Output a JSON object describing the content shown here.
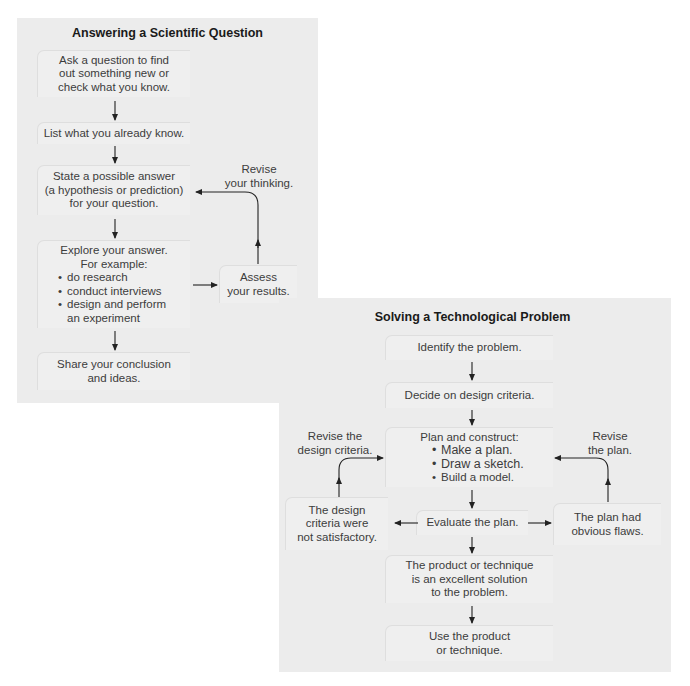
{
  "scientific": {
    "title": "Answering a Scientific Question",
    "boxes": {
      "ask": [
        "Ask a question to find",
        "out something new or",
        "check what you know."
      ],
      "list": [
        "List what you already know."
      ],
      "state": [
        "State a possible answer",
        "(a hypothesis or prediction)",
        "for your question."
      ],
      "explore": {
        "heading": [
          "Explore your answer.",
          "For example:"
        ],
        "bullets": [
          "do research",
          "conduct interviews",
          "design and perform"
        ],
        "continuation": "an experiment"
      },
      "share": [
        "Share your conclusion",
        "and ideas."
      ],
      "assess": [
        "Assess",
        "your results."
      ]
    },
    "labels": {
      "revise_thinking": [
        "Revise",
        "your thinking."
      ]
    }
  },
  "technological": {
    "title": "Solving a Technological Problem",
    "boxes": {
      "identify": [
        "Identify the problem."
      ],
      "decide": [
        "Decide on design criteria."
      ],
      "plan": {
        "heading": "Plan and construct:",
        "bullets": [
          "Make a plan.",
          "Draw a sketch.",
          "Build a model."
        ]
      },
      "evaluate": [
        "Evaluate the plan."
      ],
      "criteria_bad": [
        "The design",
        "criteria were",
        "not satisfactory."
      ],
      "plan_flawed": [
        "The plan had",
        "obvious flaws."
      ],
      "excellent": [
        "The product or technique",
        "is an excellent solution",
        "to the problem."
      ],
      "use": [
        "Use the product",
        "or technique."
      ]
    },
    "labels": {
      "revise_criteria": [
        "Revise the",
        "design criteria."
      ],
      "revise_plan": [
        "Revise",
        "the plan."
      ]
    }
  },
  "bullet_glyph": "•",
  "colors": {
    "panel_bg": "#ececec",
    "box_bg": "#efefef",
    "arrow": "#222222",
    "title": "#1a1a1a",
    "text": "#3c3c3c"
  }
}
